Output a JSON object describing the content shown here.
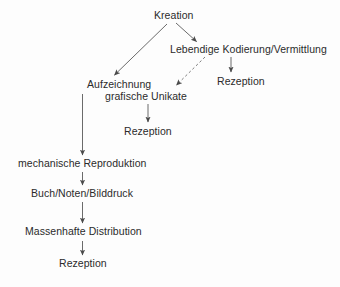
{
  "diagram": {
    "background_color": "#fdfdfd",
    "text_color": "#2b2b2b",
    "edge_color": "#5a5a5a",
    "nodes": [
      {
        "id": "kreation",
        "label": "Kreation"
      },
      {
        "id": "lebendige",
        "label": "Lebendige Kodierung/Vermittlung"
      },
      {
        "id": "rezeption_right",
        "label": "Rezeption"
      },
      {
        "id": "aufzeichnung_l1",
        "label": "Aufzeichnung"
      },
      {
        "id": "aufzeichnung_l2",
        "label": "grafische Unikate"
      },
      {
        "id": "rezeption_mid",
        "label": "Rezeption"
      },
      {
        "id": "mechanische",
        "label": "mechanische Reproduktion"
      },
      {
        "id": "buchnoten",
        "label": "Buch/Noten/Bilddruck"
      },
      {
        "id": "massenhafte",
        "label": "Massenhafte Distribution"
      },
      {
        "id": "rezeption_bot",
        "label": "Rezeption"
      }
    ],
    "edges": [
      {
        "from": "kreation",
        "to": "aufzeichnung_l1",
        "style": "solid",
        "direction": "down-left"
      },
      {
        "from": "kreation",
        "to": "lebendige",
        "style": "solid",
        "direction": "down-right"
      },
      {
        "from": "lebendige",
        "to": "aufzeichnung_l2",
        "style": "dashed",
        "direction": "down-left"
      },
      {
        "from": "lebendige",
        "to": "rezeption_right",
        "style": "solid",
        "direction": "down"
      },
      {
        "from": "aufzeichnung_l2",
        "to": "rezeption_mid",
        "style": "solid",
        "direction": "down"
      },
      {
        "from": "aufzeichnung_l1",
        "to": "mechanische",
        "style": "solid",
        "direction": "down"
      },
      {
        "from": "mechanische",
        "to": "buchnoten",
        "style": "solid",
        "direction": "down"
      },
      {
        "from": "buchnoten",
        "to": "massenhafte",
        "style": "solid",
        "direction": "down"
      },
      {
        "from": "massenhafte",
        "to": "rezeption_bot",
        "style": "solid",
        "direction": "down"
      }
    ]
  }
}
